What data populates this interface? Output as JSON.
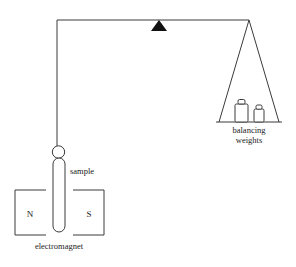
{
  "figure": {
    "background_color": "#ffffff",
    "line_color": "#3a3a3a",
    "fill_color": "#111111",
    "width": 296,
    "height": 267
  },
  "labels": {
    "sample": "sample",
    "electromagnet": "electromagnet",
    "north_pole": "N",
    "south_pole": "S",
    "balancing_weights_line1": "balancing",
    "balancing_weights_line2": "weights"
  },
  "parts": {
    "beam": {
      "name": "balance-beam",
      "left_x": 57,
      "right_x": 249,
      "y": 20
    },
    "fulcrum": {
      "name": "fulcrum-triangle",
      "apex_x": 159,
      "apex_y": 20,
      "half_width": 8,
      "height": 11
    },
    "suspension_wire": {
      "name": "suspension-wire",
      "x": 57,
      "top_y": 20,
      "bottom_y": 146
    },
    "hanger_ring": {
      "name": "hanger-ring",
      "cx": 58.5,
      "cy": 152,
      "r": 6.2
    },
    "sample_tube": {
      "name": "sample-tube",
      "x": 53,
      "y": 158,
      "width": 12,
      "height": 74,
      "corner_radius": 6
    },
    "magnet_left_pole": {
      "name": "magnet-north-pole-block",
      "x": 15,
      "y": 190,
      "width": 31,
      "height": 45
    },
    "magnet_right_pole": {
      "name": "magnet-south-pole-block",
      "x": 73,
      "y": 190,
      "width": 31,
      "height": 45
    },
    "pan_left_cord": {
      "name": "pan-left-cord",
      "x1": 249,
      "y1": 20,
      "x2": 219,
      "y2": 122
    },
    "pan_right_cord": {
      "name": "pan-right-cord",
      "x1": 249,
      "y1": 20,
      "x2": 279,
      "y2": 122
    },
    "pan_base": {
      "name": "pan-base-line",
      "x1": 219,
      "y1": 122,
      "x2": 279,
      "y2": 122
    },
    "weight_large": {
      "name": "weight-large",
      "x": 235,
      "y": 104,
      "width": 13,
      "height": 18,
      "knob_x": 238,
      "knob_y": 100,
      "knob_width": 7,
      "knob_height": 4
    },
    "weight_small": {
      "name": "weight-small",
      "x": 254,
      "y": 109,
      "width": 10,
      "height": 13,
      "knob_x": 256,
      "knob_y": 105,
      "knob_width": 6,
      "knob_height": 4
    }
  },
  "label_positions": {
    "sample": {
      "x": 70,
      "y": 172
    },
    "electromagnet": {
      "x": 59,
      "y": 246
    },
    "north_pole": {
      "x": 30,
      "y": 215
    },
    "south_pole": {
      "x": 89,
      "y": 215
    },
    "balancing_weights": {
      "x": 249,
      "y": 131
    }
  }
}
